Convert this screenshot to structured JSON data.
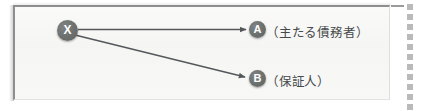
{
  "figure": {
    "background_color": "#f7f7f5",
    "frame_color": "#8d8f8e",
    "node_color": "#6e7371",
    "node_text_color": "#ffffff",
    "arrow_color": "#54585a",
    "label_color": "#46494a",
    "perforation_color": "#b9bbba"
  },
  "nodes": [
    {
      "id": "x",
      "label": "X",
      "role": ""
    },
    {
      "id": "a",
      "label": "A",
      "role": "（主たる債務者）"
    },
    {
      "id": "b",
      "label": "B",
      "role": "（保証人）"
    }
  ],
  "edges": [
    {
      "from": "X",
      "to": "A",
      "style": "solid-arrow",
      "direction": "right"
    },
    {
      "from": "X",
      "to": "B",
      "style": "solid-arrow",
      "direction": "down-right"
    }
  ],
  "labels": {
    "node_x": "X",
    "node_a": "A",
    "node_b": "B",
    "role_a": "（主たる債務者）",
    "role_b": "（保証人）"
  },
  "perforation": {
    "dot_count": 11,
    "dot_spacing_px": 10
  }
}
